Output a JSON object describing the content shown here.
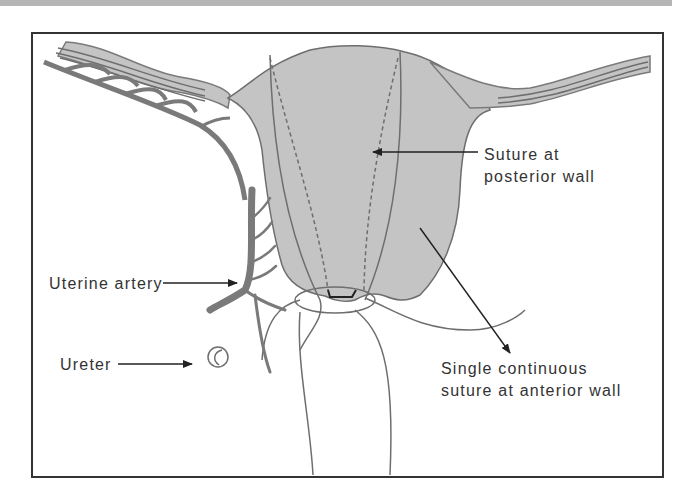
{
  "figure": {
    "type": "anatomical-diagram",
    "labels": {
      "posterior_suture_line1": "Suture at",
      "posterior_suture_line2": "posterior wall",
      "uterine_artery": "Uterine artery",
      "ureter": "Ureter",
      "anterior_suture_line1": "Single continuous",
      "anterior_suture_line2": "suture at anterior wall"
    },
    "colors": {
      "tissue_fill": "#c4c4c4",
      "outline": "#6e6e6e",
      "artery": "#7a7a7a",
      "text": "#333333",
      "frame": "#333333",
      "top_band": "#b5b5b5"
    }
  }
}
